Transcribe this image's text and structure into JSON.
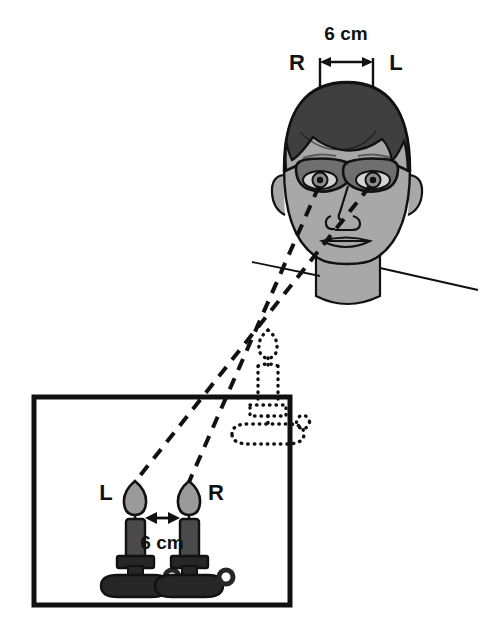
{
  "figure": {
    "background_color": "#ffffff",
    "line_color": "#111111",
    "skin_color": "#a8a8a8",
    "hair_color": "#3f3f3f",
    "lens_color": "#6f6f6f",
    "flame_color": "#9a9a9a",
    "candle_body_color": "#4a4a4a",
    "holder_color": "#262626"
  },
  "top_measure": {
    "left_label": "R",
    "right_label": "L",
    "distance_label": "6 cm"
  },
  "candles": {
    "left_label": "L",
    "right_label": "R",
    "distance_label": "6 cm"
  },
  "head": {
    "name": "person-head",
    "has_glasses": true,
    "eye_count": 2
  },
  "phantom": {
    "name": "fused-phantom-candle",
    "style": "dotted-outline"
  },
  "sight_lines": {
    "name": "crossed-sight-lines",
    "style": "dashed",
    "count": 2
  },
  "box": {
    "name": "scene-frame",
    "style": "solid-rectangle"
  }
}
